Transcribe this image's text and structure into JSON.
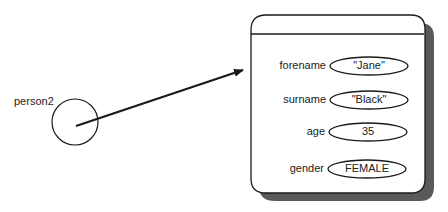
{
  "variable": {
    "name": "person2"
  },
  "object": {
    "fields": [
      {
        "name": "forename",
        "value": "\"Jane\""
      },
      {
        "name": "surname",
        "value": "\"Black\""
      },
      {
        "name": "age",
        "value": "35"
      },
      {
        "name": "gender",
        "value": "FEMALE"
      }
    ]
  },
  "colors": {
    "stroke": "#1a1a1a",
    "shadow": "#555555",
    "background": "#ffffff"
  }
}
